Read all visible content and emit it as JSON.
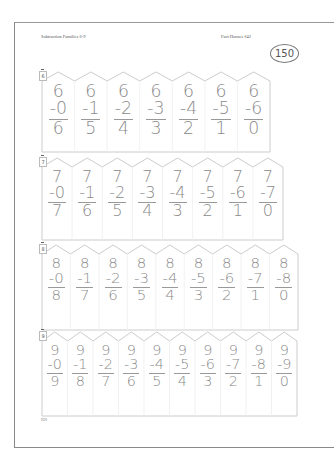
{
  "header": {
    "left_title": "Subtraction Families 6-9",
    "right_title": "Fact Houses #42",
    "page_badge": "150"
  },
  "houses": [
    {
      "label": "6",
      "minuend": "6",
      "subtrahends": [
        "-0",
        "-1",
        "-2",
        "-3",
        "-4",
        "-5",
        "-6"
      ],
      "differences": [
        "6",
        "5",
        "4",
        "3",
        "2",
        "1",
        "0"
      ]
    },
    {
      "label": "7",
      "minuend": "7",
      "subtrahends": [
        "-0",
        "-1",
        "-2",
        "-3",
        "-4",
        "-5",
        "-6",
        "-7"
      ],
      "differences": [
        "7",
        "6",
        "5",
        "4",
        "3",
        "2",
        "1",
        "0"
      ]
    },
    {
      "label": "8",
      "minuend": "8",
      "subtrahends": [
        "-0",
        "-1",
        "-2",
        "-3",
        "-4",
        "-5",
        "-6",
        "-7",
        "-8"
      ],
      "differences": [
        "8",
        "7",
        "6",
        "5",
        "4",
        "3",
        "2",
        "1",
        "0"
      ]
    },
    {
      "label": "9",
      "minuend": "9",
      "subtrahends": [
        "-0",
        "-1",
        "-2",
        "-3",
        "-4",
        "-5",
        "-6",
        "-7",
        "-8",
        "-9"
      ],
      "differences": [
        "9",
        "8",
        "7",
        "6",
        "5",
        "4",
        "3",
        "2",
        "1",
        "0"
      ]
    }
  ],
  "footer": {
    "page_code": "H26"
  },
  "colors": {
    "digit": "#8a8a8a",
    "outline": "#cccccc",
    "frame": "#888888"
  }
}
